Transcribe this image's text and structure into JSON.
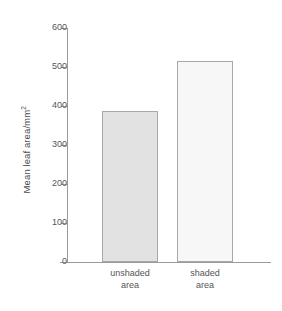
{
  "chart_data": {
    "type": "bar",
    "title": "",
    "xlabel": "",
    "ylabel": "Mean leaf area/mm",
    "ylabel_superscript": "2",
    "categories": [
      "unshaded area",
      "shaded area"
    ],
    "category_lines": [
      [
        "unshaded",
        "area"
      ],
      [
        "shaded",
        "area"
      ]
    ],
    "values": [
      387,
      515
    ],
    "ylim": [
      0,
      600
    ],
    "yticks": [
      0,
      100,
      200,
      300,
      400,
      500,
      600
    ],
    "ytick_labels": [
      "0",
      "100",
      "200",
      "300",
      "400",
      "500",
      "600"
    ],
    "grid": false,
    "legend": false,
    "bar_fills": [
      "#e2e2e2",
      "#f7f7f7"
    ],
    "bar_border_color": "#a8a8a8",
    "axis_color": "#9a9a9a",
    "text_color": "#555555"
  }
}
